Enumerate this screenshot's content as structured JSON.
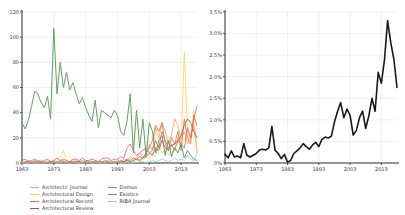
{
  "figure": {
    "background": "#ffffff",
    "axis_color": "#2b2b2b",
    "grid_color": "#e7e7e7",
    "tick_label_color": "#3a3a3a"
  },
  "chart_data": [
    {
      "type": "line",
      "title": "",
      "xlabel": "",
      "ylabel": "",
      "x_range": [
        1963,
        2018
      ],
      "x": [
        1963,
        1964,
        1965,
        1966,
        1967,
        1968,
        1969,
        1970,
        1971,
        1972,
        1973,
        1974,
        1975,
        1976,
        1977,
        1978,
        1979,
        1980,
        1981,
        1982,
        1983,
        1984,
        1985,
        1986,
        1987,
        1988,
        1989,
        1990,
        1991,
        1992,
        1993,
        1994,
        1995,
        1996,
        1997,
        1998,
        1999,
        2000,
        2001,
        2002,
        2003,
        2004,
        2005,
        2006,
        2007,
        2008,
        2009,
        2010,
        2011,
        2012,
        2013,
        2014,
        2015,
        2016,
        2017,
        2018
      ],
      "xticks": [
        1963,
        1973,
        1983,
        1993,
        2003,
        2013
      ],
      "xtick_labels": [
        "1963",
        "1973",
        "1983",
        "1993",
        "2003",
        "2013"
      ],
      "ylim": [
        0,
        120
      ],
      "yticks": [
        0,
        20,
        40,
        60,
        80,
        100,
        120
      ],
      "ytick_labels": [
        "0",
        "20",
        "40",
        "60",
        "80",
        "100",
        "120"
      ],
      "grid": true,
      "legend_position": "bottom",
      "legend_columns": [
        [
          0,
          1,
          2,
          3
        ],
        [
          4,
          5,
          6
        ]
      ],
      "series": [
        {
          "name": "Architects' Journal",
          "color": "#f0a055",
          "width": 0.8,
          "values": [
            1,
            0,
            2,
            1,
            0,
            1,
            2,
            0,
            1,
            1,
            2,
            0,
            1,
            2,
            1,
            0,
            1,
            2,
            1,
            0,
            1,
            1,
            0,
            2,
            1,
            0,
            1,
            2,
            1,
            0,
            2,
            1,
            3,
            2,
            5,
            3,
            4,
            8,
            5,
            6,
            15,
            10,
            28,
            20,
            32,
            25,
            15,
            22,
            35,
            30,
            18,
            25,
            15,
            22,
            30,
            8
          ]
        },
        {
          "name": "Architectural Design",
          "color": "#f5d54f",
          "width": 0.8,
          "values": [
            0,
            1,
            0,
            2,
            1,
            0,
            1,
            0,
            2,
            1,
            0,
            3,
            5,
            10,
            3,
            1,
            2,
            1,
            0,
            1,
            2,
            0,
            1,
            1,
            0,
            1,
            0,
            1,
            2,
            0,
            1,
            0,
            1,
            2,
            1,
            0,
            2,
            3,
            2,
            5,
            3,
            8,
            5,
            15,
            8,
            10,
            6,
            8,
            12,
            20,
            12,
            88,
            25,
            18,
            42,
            10
          ]
        },
        {
          "name": "Architectural Record",
          "color": "#e06c3c",
          "width": 0.8,
          "values": [
            0,
            1,
            1,
            0,
            2,
            1,
            0,
            1,
            0,
            1,
            1,
            0,
            2,
            1,
            0,
            1,
            1,
            0,
            1,
            2,
            0,
            1,
            0,
            1,
            1,
            0,
            2,
            1,
            0,
            1,
            1,
            2,
            1,
            3,
            2,
            4,
            3,
            5,
            4,
            8,
            12,
            18,
            30,
            25,
            32,
            15,
            10,
            20,
            15,
            25,
            10,
            35,
            20,
            15,
            38,
            30
          ]
        },
        {
          "name": "Architectural Review",
          "color": "#9e4a63",
          "width": 0.8,
          "values": [
            0,
            0,
            1,
            0,
            1,
            0,
            1,
            0,
            0,
            1,
            0,
            1,
            0,
            1,
            0,
            1,
            0,
            1,
            1,
            0,
            1,
            0,
            1,
            0,
            1,
            1,
            0,
            1,
            0,
            1,
            0,
            1,
            1,
            2,
            1,
            2,
            3,
            2,
            4,
            5,
            8,
            6,
            12,
            10,
            18,
            12,
            10,
            14,
            15,
            18,
            22,
            30,
            35,
            32,
            25,
            20
          ]
        },
        {
          "name": "Domus",
          "color": "#e25b5b",
          "width": 0.8,
          "values": [
            2,
            3,
            1,
            2,
            3,
            2,
            1,
            2,
            3,
            1,
            2,
            4,
            2,
            3,
            2,
            1,
            3,
            3,
            2,
            4,
            2,
            2,
            3,
            2,
            1,
            3,
            4,
            4,
            2,
            3,
            3,
            5,
            4,
            12,
            15,
            10,
            6,
            8,
            10,
            12,
            8,
            10,
            18,
            12,
            25,
            18,
            12,
            15,
            10,
            18,
            15,
            12,
            28,
            20,
            35,
            45
          ]
        },
        {
          "name": "Ekistics",
          "color": "#61a061",
          "width": 1.0,
          "values": [
            32,
            27,
            34,
            45,
            57,
            55,
            48,
            44,
            53,
            35,
            107,
            55,
            80,
            60,
            72,
            58,
            64,
            55,
            47,
            52,
            44,
            38,
            33,
            50,
            28,
            42,
            40,
            38,
            36,
            42,
            38,
            25,
            22,
            33,
            55,
            8,
            42,
            12,
            35,
            5,
            32,
            25,
            8,
            18,
            22,
            6,
            18,
            5,
            12,
            8,
            15,
            4,
            10,
            6,
            3,
            2
          ]
        },
        {
          "name": "RIBA Journal",
          "color": "#8fcbe2",
          "width": 0.8,
          "values": [
            0,
            0,
            0,
            1,
            0,
            0,
            1,
            0,
            0,
            0,
            1,
            0,
            0,
            1,
            0,
            0,
            0,
            1,
            0,
            0,
            0,
            1,
            0,
            0,
            1,
            0,
            0,
            1,
            0,
            0,
            1,
            0,
            0,
            1,
            0,
            1,
            0,
            1,
            1,
            0,
            1,
            2,
            1,
            2,
            3,
            2,
            1,
            2,
            4,
            2,
            3,
            2,
            6,
            3,
            2,
            8
          ]
        }
      ]
    },
    {
      "type": "line",
      "title": "",
      "xlabel": "",
      "ylabel": "",
      "x_range": [
        1963,
        2018
      ],
      "x": [
        1963,
        1964,
        1965,
        1966,
        1967,
        1968,
        1969,
        1970,
        1971,
        1972,
        1973,
        1974,
        1975,
        1976,
        1977,
        1978,
        1979,
        1980,
        1981,
        1982,
        1983,
        1984,
        1985,
        1986,
        1987,
        1988,
        1989,
        1990,
        1991,
        1992,
        1993,
        1994,
        1995,
        1996,
        1997,
        1998,
        1999,
        2000,
        2001,
        2002,
        2003,
        2004,
        2005,
        2006,
        2007,
        2008,
        2009,
        2010,
        2011,
        2012,
        2013,
        2014,
        2015,
        2016,
        2017,
        2018
      ],
      "xticks": [
        1963,
        1973,
        1983,
        1993,
        2003,
        2013
      ],
      "xtick_labels": [
        "1963",
        "1973",
        "1983",
        "1993",
        "2003",
        "2013"
      ],
      "ylim": [
        0,
        3.5
      ],
      "yticks": [
        0,
        0.5,
        1.0,
        1.5,
        2.0,
        2.5,
        3.0,
        3.5
      ],
      "ytick_labels": [
        "0%",
        "0.5%",
        "1.0%",
        "1.5%",
        "2.0%",
        "2.5%",
        "3.0%",
        "3.5%"
      ],
      "grid": true,
      "legend_position": "none",
      "series": [
        {
          "name": "share of publications",
          "color": "#1a1a1a",
          "width": 1.6,
          "values": [
            0.2,
            0.12,
            0.28,
            0.14,
            0.16,
            0.12,
            0.45,
            0.18,
            0.14,
            0.18,
            0.22,
            0.3,
            0.32,
            0.3,
            0.35,
            0.85,
            0.3,
            0.22,
            0.1,
            0.2,
            0.02,
            0.06,
            0.22,
            0.28,
            0.35,
            0.45,
            0.38,
            0.32,
            0.42,
            0.48,
            0.38,
            0.55,
            0.6,
            0.58,
            0.62,
            0.95,
            1.2,
            1.4,
            1.05,
            1.25,
            1.1,
            0.65,
            0.75,
            1.05,
            1.2,
            0.8,
            1.1,
            1.5,
            1.2,
            2.1,
            1.85,
            2.4,
            3.3,
            2.8,
            2.4,
            1.75
          ]
        }
      ]
    }
  ]
}
